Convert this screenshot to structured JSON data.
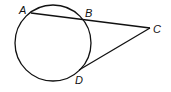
{
  "diagram": {
    "type": "geometry-secant-tangent",
    "points": {
      "A": {
        "label": "A",
        "x": 31,
        "y": 13
      },
      "B": {
        "label": "B",
        "x": 83,
        "y": 18
      },
      "C": {
        "label": "C",
        "x": 150,
        "y": 28
      },
      "D": {
        "label": "D",
        "x": 79,
        "y": 70
      }
    },
    "circle": {
      "cx": 53,
      "cy": 43,
      "r": 38
    },
    "segments": [
      [
        "A",
        "C"
      ],
      [
        "C",
        "D"
      ]
    ],
    "stroke_color": "#111111"
  },
  "labels": {
    "A": "A",
    "B": "B",
    "C": "C",
    "D": "D"
  }
}
